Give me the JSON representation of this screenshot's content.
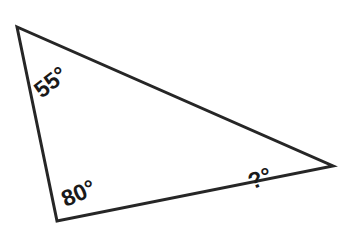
{
  "figure": {
    "type": "geometry-diagram",
    "shape": "triangle",
    "background_color": "#ffffff",
    "stroke_color": "#262626",
    "stroke_width": 3,
    "width": 353,
    "height": 238,
    "vertices": [
      {
        "name": "top-left-vertex",
        "x": 17,
        "y": 27
      },
      {
        "name": "bottom-left-vertex",
        "x": 57,
        "y": 221
      },
      {
        "name": "right-vertex",
        "x": 333,
        "y": 166
      }
    ],
    "edges": [
      {
        "name": "left-edge",
        "from": "top-left-vertex",
        "to": "bottom-left-vertex"
      },
      {
        "name": "bottom-edge",
        "from": "bottom-left-vertex",
        "to": "right-vertex"
      },
      {
        "name": "top-edge",
        "from": "right-vertex",
        "to": "top-left-vertex"
      }
    ],
    "labels": [
      {
        "name": "angle-label-top-left",
        "text": "55°",
        "value": 55,
        "unit": "degrees",
        "at_vertex": "top-left-vertex",
        "rotation_deg": -38,
        "color": "#1a1a1a"
      },
      {
        "name": "angle-label-bottom-left",
        "text": "80°",
        "value": 80,
        "unit": "degrees",
        "at_vertex": "bottom-left-vertex",
        "rotation_deg": -24,
        "color": "#1a1a1a"
      },
      {
        "name": "angle-label-right",
        "text": "?°",
        "value": null,
        "unit": "degrees",
        "at_vertex": "right-vertex",
        "rotation_deg": -21,
        "color": "#1a1a1a"
      }
    ]
  }
}
